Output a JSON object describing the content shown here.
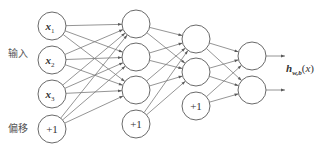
{
  "labels": {
    "input": "输入",
    "bias": "偏移",
    "output_h": "h",
    "output_sub": "w,b",
    "output_open": "(",
    "output_arg": "x",
    "output_close": ")"
  },
  "layers": [
    {
      "name": "input",
      "nodes": [
        {
          "label": "x",
          "sub": "1",
          "cx": 52,
          "cy": 26
        },
        {
          "label": "x",
          "sub": "2",
          "cx": 52,
          "cy": 60
        },
        {
          "label": "x",
          "sub": "3",
          "cx": 52,
          "cy": 94
        },
        {
          "label": "+1",
          "sub": "",
          "cx": 52,
          "cy": 129,
          "bias": true
        }
      ]
    },
    {
      "name": "hidden-1",
      "nodes": [
        {
          "label": "",
          "cx": 136,
          "cy": 24
        },
        {
          "label": "",
          "cx": 136,
          "cy": 57
        },
        {
          "label": "",
          "cx": 136,
          "cy": 90
        },
        {
          "label": "+1",
          "cx": 136,
          "cy": 124,
          "bias": true
        }
      ]
    },
    {
      "name": "hidden-2",
      "nodes": [
        {
          "label": "",
          "cx": 196,
          "cy": 39
        },
        {
          "label": "",
          "cx": 196,
          "cy": 72
        },
        {
          "label": "+1",
          "cx": 196,
          "cy": 106,
          "bias": true
        }
      ]
    },
    {
      "name": "output",
      "nodes": [
        {
          "label": "",
          "cx": 252,
          "cy": 56
        },
        {
          "label": "",
          "cx": 252,
          "cy": 90
        }
      ]
    }
  ],
  "node_radius": 14,
  "output_arrow_end_x": 285,
  "colors": {
    "stroke": "#6a6a6a",
    "edge": "#7a7a7a",
    "text": "#333333",
    "background": "#ffffff"
  }
}
